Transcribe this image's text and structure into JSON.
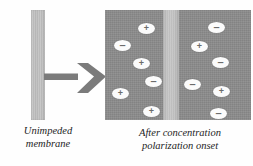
{
  "figure": {
    "background_color": "#ffffff"
  },
  "colors": {
    "membrane_light": "#c4c4c4",
    "solution_dark": "#8c8c8c",
    "arrow_gray": "#7b7b7b",
    "ion_fill": "#fbfbfb",
    "ion_glyph": "#6b6b6b",
    "text": "#1d1d1d"
  },
  "left_panel": {
    "membrane_name": "unimpeded-membrane",
    "caption_lines": [
      "Unimpeded",
      "membrane"
    ]
  },
  "arrow": {
    "name": "transition-arrow",
    "direction": "right",
    "color": "#7b7b7b"
  },
  "right_panel": {
    "caption_lines": [
      "After concentration",
      "polarization onset"
    ],
    "center_membrane_name": "polarized-membrane",
    "blocks": [
      {
        "name": "left-solution-block",
        "ions": [
          {
            "charge": "+",
            "glyph": "+",
            "x": 33,
            "y": 13
          },
          {
            "charge": "-",
            "glyph": "–",
            "x": 9,
            "y": 30
          },
          {
            "charge": "+",
            "glyph": "+",
            "x": 28,
            "y": 48
          },
          {
            "charge": "-",
            "glyph": "–",
            "x": 40,
            "y": 66
          },
          {
            "charge": "+",
            "glyph": "+",
            "x": 7,
            "y": 78
          },
          {
            "charge": "+",
            "glyph": "+",
            "x": 38,
            "y": 96
          }
        ]
      },
      {
        "name": "right-solution-block",
        "ions": [
          {
            "charge": "-",
            "glyph": "–",
            "x": 103,
            "y": 12
          },
          {
            "charge": "+",
            "glyph": "+",
            "x": 86,
            "y": 31
          },
          {
            "charge": "-",
            "glyph": "–",
            "x": 107,
            "y": 47
          },
          {
            "charge": "-",
            "glyph": "–",
            "x": 79,
            "y": 69
          },
          {
            "charge": "+",
            "glyph": "+",
            "x": 108,
            "y": 76
          },
          {
            "charge": "-",
            "glyph": "–",
            "x": 105,
            "y": 98
          }
        ]
      }
    ]
  }
}
